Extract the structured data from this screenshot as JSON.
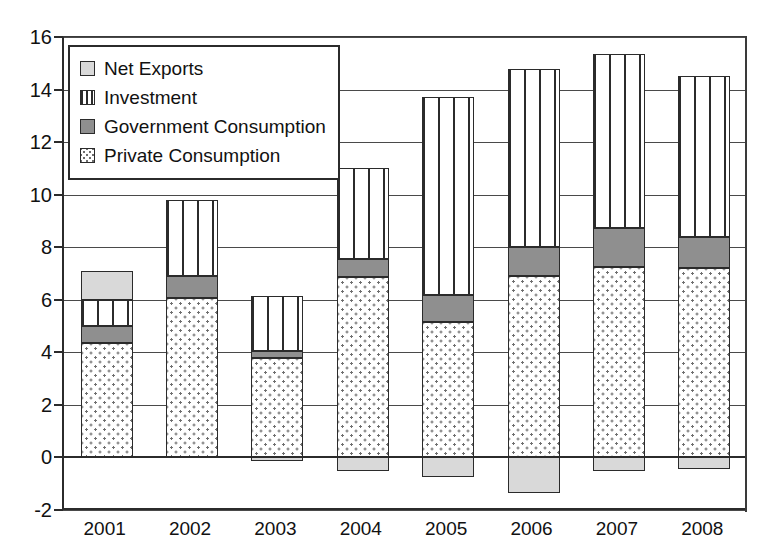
{
  "chart_data": {
    "type": "bar",
    "subtype": "stacked-bar-with-negative",
    "title": "",
    "xlabel": "",
    "ylabel": "",
    "ylim": [
      -2,
      16
    ],
    "ytick_step": 2,
    "yticks": [
      -2,
      0,
      2,
      4,
      6,
      8,
      10,
      12,
      14,
      16
    ],
    "ytick_labels": [
      "-2",
      "0",
      "2",
      "4",
      "6",
      "8",
      "10",
      "12",
      "14",
      "16"
    ],
    "grid": true,
    "legend_position": "top-left",
    "categories": [
      "2001",
      "2002",
      "2003",
      "2004",
      "2005",
      "2006",
      "2007",
      "2008"
    ],
    "series": [
      {
        "name": "Private Consumption",
        "pattern": "dotted",
        "color": "#ffffff",
        "values": [
          4.35,
          6.05,
          3.8,
          6.85,
          5.15,
          6.9,
          7.25,
          7.2
        ]
      },
      {
        "name": "Government Consumption",
        "pattern": "solid-dark-gray",
        "color": "#8f8f8f",
        "values": [
          0.65,
          0.85,
          0.25,
          0.7,
          1.05,
          1.1,
          1.5,
          1.2
        ]
      },
      {
        "name": "Investment",
        "pattern": "vertical-lines",
        "color": "#ffffff",
        "values": [
          1.0,
          2.9,
          2.1,
          3.45,
          7.5,
          6.8,
          6.6,
          6.1
        ]
      },
      {
        "name": "Net Exports",
        "pattern": "solid-light-gray",
        "color": "#d9d9d9",
        "values": [
          1.1,
          0.0,
          -0.15,
          -0.5,
          -0.75,
          -1.35,
          -0.5,
          -0.45
        ]
      }
    ],
    "totals_positive": [
      7.1,
      9.8,
      6.15,
      11.0,
      13.7,
      14.8,
      15.35,
      14.5
    ]
  },
  "legend": {
    "items": [
      {
        "label": "Net Exports",
        "swatch": "fill-netexports"
      },
      {
        "label": "Investment",
        "swatch": "fill-investment"
      },
      {
        "label": "Government Consumption",
        "swatch": "fill-government"
      },
      {
        "label": "Private Consumption",
        "swatch": "fill-private"
      }
    ]
  }
}
